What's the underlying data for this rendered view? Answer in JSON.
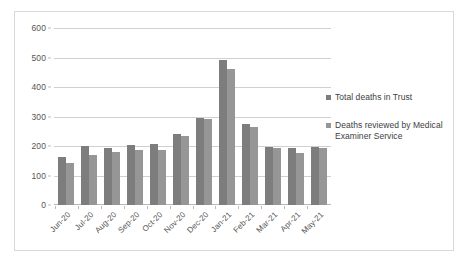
{
  "chart_data": {
    "type": "bar",
    "title": "",
    "subtitle": "",
    "xlabel": "",
    "ylabel": "",
    "ylim": [
      0,
      600
    ],
    "ytick_step": 100,
    "yticks": [
      "0",
      "100",
      "200",
      "300",
      "400",
      "500",
      "600"
    ],
    "grid": true,
    "legend_position": "right",
    "categories": [
      "Jun-20",
      "Jul-20",
      "Aug-20",
      "Sep-20",
      "Oct-20",
      "Nov-20",
      "Dec-20",
      "Jan-21",
      "Feb-21",
      "Mar-21",
      "Apr-21",
      "May-21"
    ],
    "series": [
      {
        "name": "Total deaths in Trust",
        "color": "#7d7d7d",
        "values": [
          163,
          200,
          194,
          203,
          206,
          240,
          295,
          490,
          275,
          198,
          193,
          196
        ]
      },
      {
        "name": "Deaths reviewed by Medical Examiner Service",
        "color": "#969696",
        "values": [
          143,
          170,
          180,
          188,
          186,
          235,
          292,
          461,
          265,
          192,
          178,
          193
        ]
      }
    ]
  },
  "legend": {
    "items": [
      {
        "label": "Total deaths in Trust",
        "swatch": "series-0-swatch"
      },
      {
        "label": "Deaths reviewed by Medical Examiner Service",
        "swatch": "series-1-swatch"
      }
    ]
  },
  "colors": {
    "series_0": "#7d7d7d",
    "series_1": "#969696",
    "gridline": "#d0d0d0",
    "frame_border": "#d9d9d9",
    "tick_text": "#555555",
    "legend_text": "#404040",
    "background": "#ffffff"
  }
}
